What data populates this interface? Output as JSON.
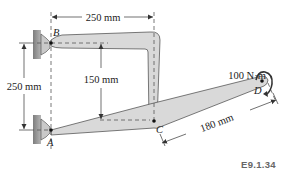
{
  "figure": {
    "id": "E9.1.34",
    "points": {
      "A": "A",
      "B": "B",
      "C": "C",
      "D": "D"
    },
    "dimensions": {
      "top_horizontal": "250 mm",
      "vertical_left": "250 mm",
      "vertical_inner": "150 mm",
      "cd_length": "180 mm"
    },
    "moment": "100 N·m",
    "colors": {
      "member_fill": "#d9d9d9",
      "outline": "#444444",
      "wall": "#8f8f8f",
      "label": "#222222",
      "figure_id": "#666666"
    }
  }
}
